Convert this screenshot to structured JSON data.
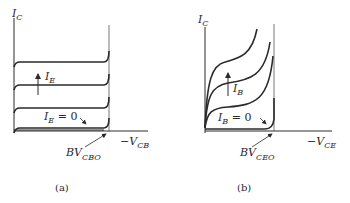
{
  "figure": {
    "panels": [
      {
        "id": "a",
        "caption": "(a)",
        "y_axis_label": "I",
        "y_axis_sub": "C",
        "x_axis_label": "−V",
        "x_axis_sub": "CB",
        "family_arrow_label": "I",
        "family_arrow_sub": "E",
        "zero_curve_label": "I",
        "zero_curve_sub": "E",
        "zero_curve_eq": " = 0",
        "breakdown_label": "BV",
        "breakdown_sub": "CBO"
      },
      {
        "id": "b",
        "caption": "(b)",
        "y_axis_label": "I",
        "y_axis_sub": "C",
        "x_axis_label": "−V",
        "x_axis_sub": "CE",
        "family_arrow_label": "I",
        "family_arrow_sub": "B",
        "zero_curve_label": "I",
        "zero_curve_sub": "B",
        "zero_curve_eq": " = 0",
        "breakdown_label": "BV",
        "breakdown_sub": "CEO"
      }
    ],
    "colors": {
      "ink": "#2a2a2a",
      "background": "#ffffff"
    }
  }
}
